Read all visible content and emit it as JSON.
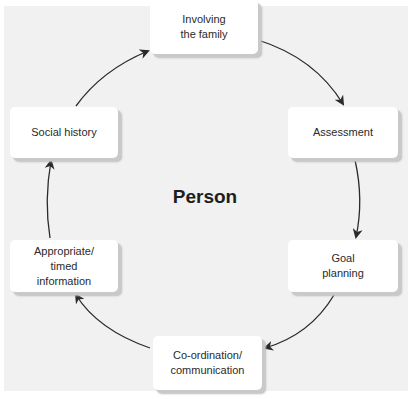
{
  "diagram": {
    "type": "cycle",
    "center_label": "Person",
    "nodes": [
      {
        "id": "involving",
        "label": "Involving\nthe family"
      },
      {
        "id": "assessment",
        "label": "Assessment"
      },
      {
        "id": "goal",
        "label": "Goal\nplanning"
      },
      {
        "id": "coordination",
        "label": "Co-ordination/\ncommunication"
      },
      {
        "id": "appropriate",
        "label": "Appropriate/\ntimed\ninformation"
      },
      {
        "id": "social",
        "label": "Social history"
      }
    ],
    "edges": [
      {
        "from": "involving",
        "to": "assessment"
      },
      {
        "from": "assessment",
        "to": "goal"
      },
      {
        "from": "goal",
        "to": "coordination"
      },
      {
        "from": "coordination",
        "to": "appropriate"
      },
      {
        "from": "appropriate",
        "to": "social"
      },
      {
        "from": "social",
        "to": "involving"
      }
    ],
    "colors": {
      "background": "#f1f1f1",
      "box": "#ffffff",
      "shadow": "#c4c4c4",
      "arrow": "#2a2a2a",
      "text": "#2a2a2a"
    }
  }
}
